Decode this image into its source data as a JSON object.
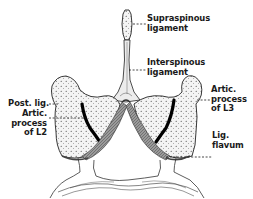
{
  "figure": {
    "type": "anatomical-diagram",
    "colors": {
      "ink": "#1a1a1a",
      "background": "#ffffff",
      "shading": "#888888"
    }
  },
  "labels": {
    "supraspinous": {
      "line1": "Supraspinous",
      "line2": "ligament"
    },
    "interspinous": {
      "line1": "Interspinous",
      "line2": "ligament"
    },
    "post_lig": {
      "line1": "Post. lig."
    },
    "artic_l2": {
      "line1": "Artic.",
      "line2": "process",
      "line3": "of L2"
    },
    "artic_l3": {
      "line1": "Artic.",
      "line2": "process",
      "line3": "of L3"
    },
    "lig_flavum": {
      "line1": "Lig.",
      "line2": "flavum"
    }
  }
}
